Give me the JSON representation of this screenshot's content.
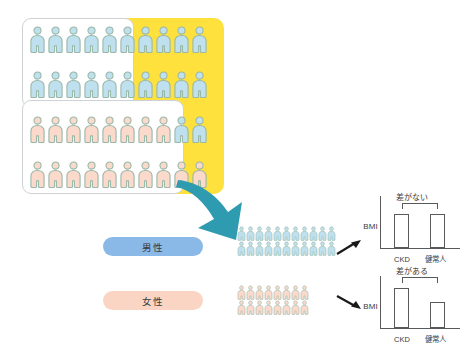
{
  "figure": {
    "title_present": false,
    "cohort": {
      "name": "population-grid",
      "highlight_color": "#ffe13d",
      "male_color": "#bfe0ef",
      "female_color": "#fbd9cb",
      "outline_color": "#9ab8a8",
      "rows": [
        {
          "row": 1,
          "people": [
            "male",
            "male",
            "male",
            "male",
            "male",
            "male",
            "male",
            "male",
            "male",
            "male"
          ]
        },
        {
          "row": 2,
          "people": [
            "male",
            "male",
            "male",
            "male",
            "male",
            "male",
            "male",
            "male",
            "male",
            "male"
          ]
        },
        {
          "row": 3,
          "people": [
            "female",
            "female",
            "female",
            "female",
            "female",
            "female",
            "female",
            "female",
            "male",
            "male"
          ]
        },
        {
          "row": 4,
          "people": [
            "female",
            "female",
            "female",
            "female",
            "female",
            "female",
            "female",
            "female",
            "female",
            "female"
          ]
        }
      ],
      "white_box_top": {
        "cols": 3,
        "rows": 2
      },
      "white_box_bottom": {
        "cols": 8,
        "rows": 2
      }
    },
    "arrow": {
      "name": "big-down-right-arrow",
      "color": "#2e9bb0"
    },
    "groups": [
      {
        "id": "male",
        "pill_label": "男性",
        "pill_color": "#8ab9e8",
        "person_color": "#bfe0ef",
        "rows": 2,
        "per_row": 11,
        "chart": {
          "annotation": "差がない",
          "ylabel": "BMI",
          "categories": [
            "CKD",
            "健常人"
          ],
          "values": [
            34,
            34
          ]
        }
      },
      {
        "id": "female",
        "pill_label": "女性",
        "pill_color": "#fbd5c4",
        "person_color": "#fbd9cb",
        "rows": 2,
        "per_row": 8,
        "chart": {
          "annotation": "差がある",
          "ylabel": "BMI",
          "categories": [
            "CKD",
            "健常人"
          ],
          "values": [
            40,
            26
          ]
        }
      }
    ]
  },
  "chart_data": [
    {
      "type": "bar",
      "id": "male-bmi-chart",
      "title": "差がない",
      "xlabel": "",
      "ylabel": "BMI",
      "categories": [
        "CKD",
        "健常人"
      ],
      "values": [
        34,
        34
      ],
      "ylim": [
        0,
        52
      ],
      "grid": false,
      "legend": "none",
      "annotation": "差がない",
      "annotation_meaning_bracket": true
    },
    {
      "type": "bar",
      "id": "female-bmi-chart",
      "title": "差がある",
      "xlabel": "",
      "ylabel": "BMI",
      "categories": [
        "CKD",
        "健常人"
      ],
      "values": [
        40,
        26
      ],
      "ylim": [
        0,
        52
      ],
      "grid": false,
      "legend": "none",
      "annotation": "差がある",
      "annotation_meaning_bracket": true
    }
  ]
}
